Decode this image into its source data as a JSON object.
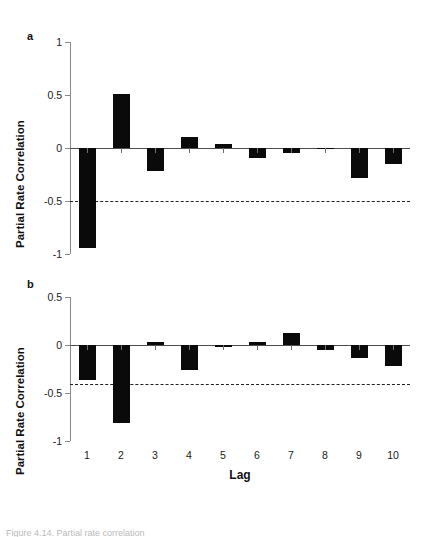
{
  "figure": {
    "background": "#ffffff",
    "bar_color": "#0a0a0a",
    "axis_color": "#8a8a8a",
    "ci_color": "#222222",
    "xaxis_title": "Lag",
    "caption_partial": "Figure 4.14.  Partial rate correlation"
  },
  "panel_a": {
    "label": "a",
    "ylabel": "Partial Rate Correlation",
    "yticks": [
      "1",
      "0.5",
      "0",
      "-0.5",
      "-1"
    ]
  },
  "panel_b": {
    "label": "b",
    "ylabel": "Partial Rate Correlation",
    "yticks": [
      "0.5",
      "0",
      "-0.5",
      "-1"
    ]
  },
  "xticks": [
    "1",
    "2",
    "3",
    "4",
    "5",
    "6",
    "7",
    "8",
    "9",
    "10"
  ],
  "chart_data": [
    {
      "type": "bar",
      "panel": "a",
      "title": "",
      "xlabel": "Lag",
      "ylabel": "Partial Rate Correlation",
      "categories": [
        1,
        2,
        3,
        4,
        5,
        6,
        7,
        8,
        9,
        10
      ],
      "values": [
        -0.94,
        0.51,
        -0.22,
        0.1,
        0.04,
        -0.09,
        -0.05,
        -0.01,
        -0.28,
        -0.15
      ],
      "ylim": [
        -1,
        1
      ],
      "ytick_values": [
        1,
        0.5,
        0,
        -0.5,
        -1
      ],
      "grid": false,
      "legend": "none",
      "annotations": [
        {
          "kind": "confidence-bound",
          "style": "dashed",
          "value": -0.5
        }
      ]
    },
    {
      "type": "bar",
      "panel": "b",
      "title": "",
      "xlabel": "Lag",
      "ylabel": "Partial Rate Correlation",
      "categories": [
        1,
        2,
        3,
        4,
        5,
        6,
        7,
        8,
        9,
        10
      ],
      "values": [
        -0.36,
        -0.81,
        0.03,
        -0.26,
        -0.02,
        0.03,
        0.12,
        -0.05,
        -0.14,
        -0.22
      ],
      "ylim": [
        -1,
        0.5
      ],
      "ytick_values": [
        0.5,
        0,
        -0.5,
        -1
      ],
      "grid": false,
      "legend": "none",
      "annotations": [
        {
          "kind": "confidence-bound",
          "style": "dashed",
          "value": -0.41
        }
      ]
    }
  ]
}
